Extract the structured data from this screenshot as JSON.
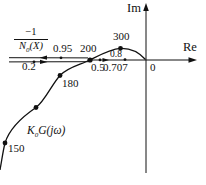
{
  "axes": {
    "im_label": "Im",
    "re_label": "Re",
    "origin_label": "0"
  },
  "nyquist_curve": {
    "label": {
      "base": "K",
      "sub": "0",
      "suffix": "G(jω)"
    },
    "frequency_marks": [
      {
        "value": "150"
      },
      {
        "value": "180"
      },
      {
        "value": "200"
      },
      {
        "value": "300"
      }
    ]
  },
  "describing_function_locus": {
    "label": {
      "numerator": "−1",
      "den_base": "N",
      "den_sub": "0",
      "den_suffix": "(X)"
    },
    "amplitude_marks": [
      {
        "value": "0.2"
      },
      {
        "value": "0.95"
      },
      {
        "value": "0.5"
      },
      {
        "value": "0.8"
      },
      {
        "value": "0.707"
      }
    ]
  },
  "colors": {
    "ink": "#111111",
    "background": "#ffffff"
  }
}
